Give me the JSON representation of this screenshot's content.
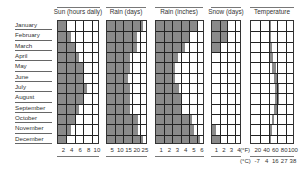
{
  "chart_data": [
    {
      "type": "bar",
      "title": "Sun (hours daily)",
      "orientation": "horizontal",
      "categories": [
        "January",
        "February",
        "March",
        "April",
        "May",
        "June",
        "July",
        "August",
        "September",
        "October",
        "November",
        "December"
      ],
      "values": [
        2,
        3,
        4,
        5,
        6,
        6,
        7,
        6,
        5,
        4,
        3,
        2
      ],
      "xlim": [
        0,
        10
      ],
      "ticks": [
        "2",
        "4",
        "6",
        "8",
        "10"
      ]
    },
    {
      "type": "bar",
      "title": "Rain (days)",
      "orientation": "horizontal",
      "categories": [
        "January",
        "February",
        "March",
        "April",
        "May",
        "June",
        "July",
        "August",
        "September",
        "October",
        "November",
        "December"
      ],
      "values": [
        22,
        18,
        18,
        14,
        14,
        13,
        14,
        14,
        14,
        19,
        19,
        22
      ],
      "xlim": [
        0,
        25
      ],
      "ticks": [
        "5",
        "10",
        "15",
        "20",
        "25"
      ]
    },
    {
      "type": "bar",
      "title": "Rain (inches)",
      "orientation": "horizontal",
      "categories": [
        "January",
        "February",
        "March",
        "April",
        "May",
        "June",
        "July",
        "August",
        "September",
        "October",
        "November",
        "December"
      ],
      "values": [
        5.0,
        4.2,
        3.5,
        2.7,
        2.3,
        2.3,
        2.8,
        3.1,
        3.2,
        4.4,
        4.6,
        5.4
      ],
      "xlim": [
        0,
        6
      ],
      "ticks": [
        "1",
        "2",
        "3",
        "4",
        "5",
        "6"
      ]
    },
    {
      "type": "bar",
      "title": "Snow (days)",
      "orientation": "horizontal",
      "categories": [
        "January",
        "February",
        "March",
        "April",
        "May",
        "June",
        "July",
        "August",
        "September",
        "October",
        "November",
        "December"
      ],
      "values": [
        2,
        2,
        1,
        0,
        0,
        0,
        0,
        0,
        0,
        0,
        0.5,
        1
      ],
      "xlim": [
        0,
        4
      ],
      "ticks": [
        "1",
        "2",
        "3",
        "4"
      ]
    },
    {
      "type": "area",
      "title": "Temperature",
      "categories": [
        "January",
        "February",
        "March",
        "April",
        "May",
        "June",
        "July",
        "August",
        "September",
        "October",
        "November",
        "December"
      ],
      "series": [
        {
          "name": "Min (°F)",
          "values": [
            40,
            40,
            41,
            44,
            47,
            52,
            55,
            55,
            52,
            48,
            44,
            41
          ]
        },
        {
          "name": "Max (°F)",
          "values": [
            45,
            45,
            47,
            51,
            56,
            61,
            64,
            63,
            59,
            53,
            48,
            45
          ]
        }
      ],
      "xlim": [
        0,
        100
      ],
      "ticks_f": [
        "(°F)",
        "20",
        "40",
        "60",
        "80",
        "100"
      ],
      "ticks_c": [
        "(°C)",
        "-7",
        "4",
        "16",
        "27",
        "38"
      ]
    }
  ],
  "labels": {
    "months": [
      "January",
      "February",
      "March",
      "April",
      "May",
      "June",
      "July",
      "August",
      "September",
      "October",
      "November",
      "December"
    ],
    "sun_title": "Sun (hours daily)",
    "rain_days_title": "Rain (days)",
    "rain_inches_title": "Rain (inches)",
    "snow_title": "Snow (days)",
    "temp_title": "Temperature",
    "sun_ticks": [
      "2",
      "4",
      "6",
      "8",
      "10"
    ],
    "rain_days_ticks": [
      "5",
      "10",
      "15",
      "20",
      "25"
    ],
    "rain_inches_ticks": [
      "1",
      "2",
      "3",
      "4",
      "5",
      "6"
    ],
    "snow_ticks": [
      "1",
      "2",
      "3",
      "4"
    ],
    "temp_f_label": "(°F)",
    "temp_f_ticks": [
      "20",
      "40",
      "60",
      "80",
      "100"
    ],
    "temp_c_label": "(°C)",
    "temp_c_ticks": [
      "-7",
      "4",
      "16",
      "27",
      "38"
    ]
  },
  "colors": {
    "bar": "#8a8a8a",
    "grid": "#222222",
    "text": "#333333"
  }
}
